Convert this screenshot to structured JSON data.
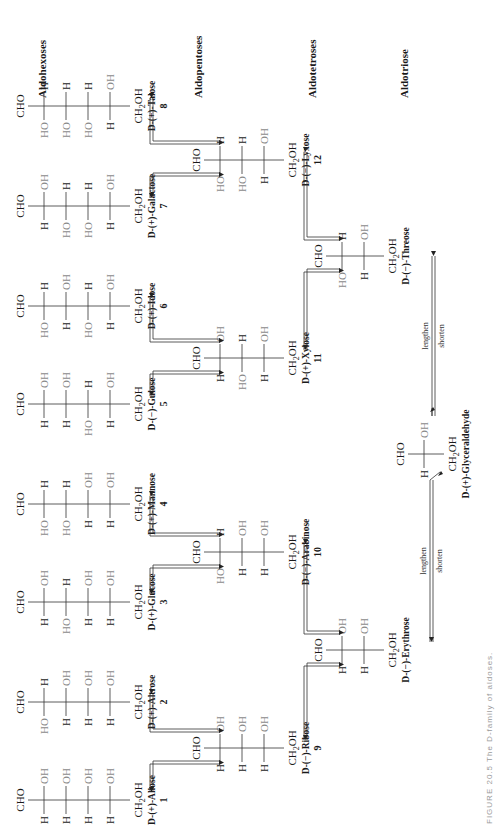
{
  "categories": {
    "hexoses": "Aldohexoses",
    "pentoses": "Aldopentoses",
    "tetroses": "Aldotetroses",
    "triose": "Aldotriose"
  },
  "molecules": [
    {
      "id": 1,
      "name": "D-(+)-Allose",
      "number": "1",
      "top": "CHO",
      "bottom": "CH2OH",
      "rows": [
        [
          "H",
          "OH"
        ],
        [
          "H",
          "OH"
        ],
        [
          "H",
          "OH"
        ],
        [
          "H",
          "OH"
        ]
      ]
    },
    {
      "id": 2,
      "name": "D-(+)-Altrose",
      "number": "2",
      "top": "CHO",
      "bottom": "CH2OH",
      "rows": [
        [
          "HO",
          "H"
        ],
        [
          "H",
          "OH"
        ],
        [
          "H",
          "OH"
        ],
        [
          "H",
          "OH"
        ]
      ]
    },
    {
      "id": 3,
      "name": "D-(+)-Glucose",
      "number": "3",
      "top": "CHO",
      "bottom": "CH2OH",
      "rows": [
        [
          "H",
          "OH"
        ],
        [
          "HO",
          "H"
        ],
        [
          "H",
          "OH"
        ],
        [
          "H",
          "OH"
        ]
      ]
    },
    {
      "id": 4,
      "name": "D-(+)-Mannose",
      "number": "4",
      "top": "CHO",
      "bottom": "CH2OH",
      "rows": [
        [
          "HO",
          "H"
        ],
        [
          "HO",
          "H"
        ],
        [
          "H",
          "OH"
        ],
        [
          "H",
          "OH"
        ]
      ]
    },
    {
      "id": 5,
      "name": "D-(−)-Gulose",
      "number": "5",
      "top": "CHO",
      "bottom": "CH2OH",
      "rows": [
        [
          "H",
          "OH"
        ],
        [
          "H",
          "OH"
        ],
        [
          "HO",
          "H"
        ],
        [
          "H",
          "OH"
        ]
      ]
    },
    {
      "id": 6,
      "name": "D-(+)-Idose",
      "number": "6",
      "top": "CHO",
      "bottom": "CH2OH",
      "rows": [
        [
          "HO",
          "H"
        ],
        [
          "H",
          "OH"
        ],
        [
          "HO",
          "H"
        ],
        [
          "H",
          "OH"
        ]
      ]
    },
    {
      "id": 7,
      "name": "D-(+)-Galactose",
      "number": "7",
      "top": "CHO",
      "bottom": "CH2OH",
      "rows": [
        [
          "H",
          "OH"
        ],
        [
          "HO",
          "H"
        ],
        [
          "HO",
          "H"
        ],
        [
          "H",
          "OH"
        ]
      ]
    },
    {
      "id": 8,
      "name": "D-(+)-Talose",
      "number": "8",
      "top": "CHO",
      "bottom": "CH2OH",
      "rows": [
        [
          "HO",
          "H"
        ],
        [
          "HO",
          "H"
        ],
        [
          "HO",
          "H"
        ],
        [
          "H",
          "OH"
        ]
      ]
    },
    {
      "id": 9,
      "name": "D-(−)-Ribose",
      "number": "9",
      "top": "CHO",
      "bottom": "CH2OH",
      "rows": [
        [
          "H",
          "OH"
        ],
        [
          "H",
          "OH"
        ],
        [
          "H",
          "OH"
        ]
      ]
    },
    {
      "id": 10,
      "name": "D-(−)-Arabinose",
      "number": "10",
      "top": "CHO",
      "bottom": "CH2OH",
      "rows": [
        [
          "HO",
          "H"
        ],
        [
          "H",
          "OH"
        ],
        [
          "H",
          "OH"
        ]
      ]
    },
    {
      "id": 11,
      "name": "D-(+)-Xylose",
      "number": "11",
      "top": "CHO",
      "bottom": "CH2OH",
      "rows": [
        [
          "H",
          "OH"
        ],
        [
          "HO",
          "H"
        ],
        [
          "H",
          "OH"
        ]
      ]
    },
    {
      "id": 12,
      "name": "D-(−)-Lyxose",
      "number": "12",
      "top": "CHO",
      "bottom": "CH2OH",
      "rows": [
        [
          "HO",
          "H"
        ],
        [
          "HO",
          "H"
        ],
        [
          "H",
          "OH"
        ]
      ]
    },
    {
      "id": 13,
      "name": "D-(−)-Erythrose",
      "number": "",
      "top": "CHO",
      "bottom": "CH2OH",
      "rows": [
        [
          "H",
          "OH"
        ],
        [
          "H",
          "OH"
        ]
      ]
    },
    {
      "id": 14,
      "name": "D-(−)-Threose",
      "number": "",
      "top": "CHO",
      "bottom": "CH2OH",
      "rows": [
        [
          "HO",
          "H"
        ],
        [
          "H",
          "OH"
        ]
      ]
    },
    {
      "id": 15,
      "name": "D-(+)-Glyceraldehyde",
      "number": "",
      "top": "CHO",
      "bottom": "CH2OH",
      "rows": [
        [
          "H",
          "OH"
        ]
      ]
    }
  ],
  "arrows": {
    "lengthen": "lengthen",
    "shorten": "shorten"
  },
  "caption": "FIGURE 20.5 The D-family of aldoses."
}
